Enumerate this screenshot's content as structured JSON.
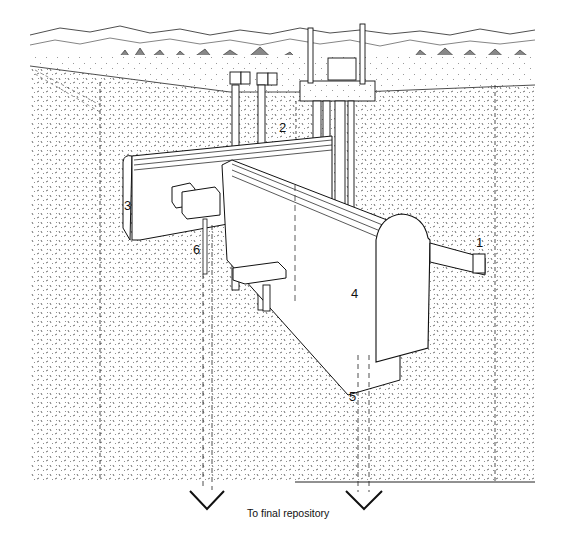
{
  "figure": {
    "caption": "To final repository",
    "labels": [
      {
        "id": "1",
        "text": "1",
        "x": 476,
        "y": 236
      },
      {
        "id": "2",
        "text": "2",
        "x": 279,
        "y": 121
      },
      {
        "id": "3",
        "text": "3",
        "x": 124,
        "y": 199
      },
      {
        "id": "4",
        "text": "4",
        "x": 351,
        "y": 287
      },
      {
        "id": "5",
        "text": "5",
        "x": 349,
        "y": 390
      },
      {
        "id": "6",
        "text": "6",
        "x": 193,
        "y": 243
      }
    ],
    "colors": {
      "ink": "#111111",
      "ground": "#d9d9d9",
      "paper": "#ffffff"
    }
  }
}
